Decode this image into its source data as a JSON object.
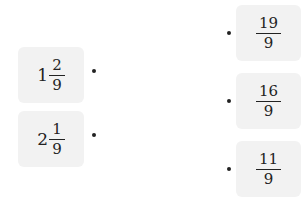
{
  "left_items": [
    {
      "whole": "1",
      "numerator": "2",
      "denominator": "9"
    },
    {
      "whole": "2",
      "numerator": "1",
      "denominator": "9"
    }
  ],
  "right_items": [
    {
      "numerator": "19",
      "denominator": "9"
    },
    {
      "numerator": "16",
      "denominator": "9"
    },
    {
      "numerator": "11",
      "denominator": "9"
    }
  ]
}
